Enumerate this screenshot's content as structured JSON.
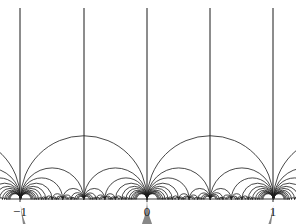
{
  "figure": {
    "colors": {
      "background": "#ffffff",
      "stroke": "#1a1a1a",
      "axis": "#3a3a3a",
      "shaded_region_fill": "#878787",
      "label": "#1a1a1a"
    },
    "stroke_width": 0.8,
    "axis_stroke_width": 1.1
  },
  "axis": {
    "name": "real-axis",
    "y_pixel": 199,
    "x_start_pixel": 6,
    "x_end_pixel": 290,
    "unit_pixels": 126.5,
    "origin_x_pixel": 147,
    "ticks": [
      {
        "value": -1,
        "label": "−1",
        "x_pixel": 20
      },
      {
        "value": 0,
        "label": "0",
        "x_pixel": 147
      },
      {
        "value": 1,
        "label": "1",
        "x_pixel": 273
      }
    ],
    "label_y_pixel": 205
  },
  "chart_data": {
    "type": "line",
    "xlabel": "",
    "ylabel": "",
    "xlim": [
      -1.115,
      1.13
    ],
    "ylim": [
      0,
      1.575
    ],
    "grid": false,
    "legend": "none",
    "tick_labels": [
      "−1",
      "0",
      "1"
    ],
    "tick_values": [
      -1,
      0,
      1
    ],
    "vertical_geodesics": [
      {
        "x": -1,
        "x_pixel": 20,
        "top_y_pixel": 8
      },
      {
        "x": -0.5,
        "x_pixel": 84,
        "top_y_pixel": 8
      },
      {
        "x": 0,
        "x_pixel": 147,
        "top_y_pixel": 8
      },
      {
        "x": 0.5,
        "x_pixel": 210,
        "top_y_pixel": 8
      },
      {
        "x": 1,
        "x_pixel": 273,
        "top_y_pixel": 8
      }
    ],
    "semicircle_geodesics_note": "Each pair [p/q, r/s] of Farey neighbours (|ps-rq| = 1) on the real axis is joined by a semicircle orthogonal to the axis. Generated up to denominator 12 over the interval [-2, 2].",
    "max_denominator": 12,
    "generation_interval": [
      -2,
      2
    ],
    "shaded_region": {
      "name": "ideal-triangle",
      "fill": "#878787",
      "vertices_on_real_axis": [
        -1,
        0,
        1
      ],
      "boundary_arcs": [
        {
          "from": -1,
          "to": 1,
          "role": "upper"
        },
        {
          "from": -1,
          "to": 0,
          "role": "lower-left"
        },
        {
          "from": 0,
          "to": 1,
          "role": "lower-right"
        }
      ],
      "apex_y_pixel": 72.5
    }
  }
}
